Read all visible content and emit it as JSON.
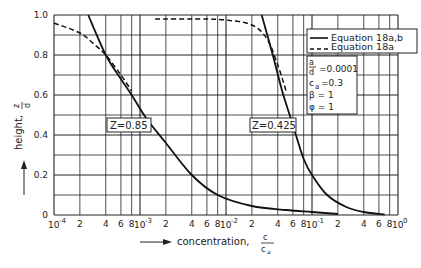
{
  "chart_data": {
    "type": "line",
    "title": "",
    "xlabel": "concentration, c / c_a",
    "ylabel": "height, z / d",
    "x_scale": "log",
    "xlim": [
      0.0001,
      1
    ],
    "ylim": [
      0,
      1.0
    ],
    "grid": true,
    "x_tick_labels": [
      "10^-4",
      "2",
      "4",
      "6",
      "8",
      "10^-3",
      "2",
      "4",
      "6",
      "8",
      "10^-2",
      "2",
      "4",
      "6",
      "8",
      "10^-1",
      "2",
      "4",
      "6",
      "8",
      "10^0"
    ],
    "y_tick_labels": [
      "0",
      "0.2",
      "0.4",
      "0.6",
      "0.8",
      "1.0"
    ],
    "legend": {
      "position": "upper right",
      "entries": [
        {
          "label": "Equation 18a,b",
          "style": "solid"
        },
        {
          "label": "Equation 18a",
          "style": "dashed"
        }
      ]
    },
    "parameters": [
      "a/d = 0.0001",
      "c_a = 0.3",
      "β = 1",
      "φ = 1"
    ],
    "annotations": [
      "Z=0.85",
      "Z=0.425"
    ],
    "series": [
      {
        "name": "Z=0.85, Equation 18a,b",
        "style": "solid",
        "x": [
          0.00025,
          0.0004,
          0.0006,
          0.0008,
          0.0012,
          0.002,
          0.004,
          0.008,
          0.02,
          0.05,
          0.1,
          0.2
        ],
        "y": [
          1.0,
          0.8,
          0.68,
          0.6,
          0.48,
          0.36,
          0.2,
          0.1,
          0.045,
          0.025,
          0.015,
          0.005
        ]
      },
      {
        "name": "Z=0.85, Equation 18a",
        "style": "dashed",
        "x": [
          0.0001,
          0.0002,
          0.0003,
          0.0004,
          0.0006,
          0.0008
        ],
        "y": [
          0.96,
          0.91,
          0.85,
          0.8,
          0.7,
          0.62
        ]
      },
      {
        "name": "Z=0.425, Equation 18a,b",
        "style": "solid",
        "x": [
          0.026,
          0.035,
          0.045,
          0.055,
          0.065,
          0.08,
          0.1,
          0.15,
          0.25,
          0.4,
          0.7
        ],
        "y": [
          1.0,
          0.8,
          0.62,
          0.5,
          0.4,
          0.28,
          0.2,
          0.1,
          0.04,
          0.015,
          0.002
        ]
      },
      {
        "name": "Z=0.425, Equation 18a",
        "style": "dashed",
        "x": [
          0.0015,
          0.005,
          0.01,
          0.02,
          0.03,
          0.04,
          0.05
        ],
        "y": [
          0.98,
          0.98,
          0.975,
          0.95,
          0.88,
          0.75,
          0.62
        ]
      }
    ]
  },
  "labels": {
    "y_axis": "height,",
    "y_frac_num": "z",
    "y_frac_den": "d",
    "x_axis": "concentration,",
    "x_frac_num": "c",
    "x_frac_den": "c",
    "x_frac_den_sub": "a",
    "legend_solid": "Equation 18a,b",
    "legend_dashed": "Equation 18a",
    "param_a_num": "a",
    "param_a_den": "d",
    "param_a_val": "=0.0001",
    "param_ca": "c",
    "param_ca_sub": "a",
    "param_ca_val": "=0.3",
    "param_beta": "β  = 1",
    "param_phi": "φ  = 1",
    "z1": "Z=0.85",
    "z2": "Z=0.425"
  }
}
